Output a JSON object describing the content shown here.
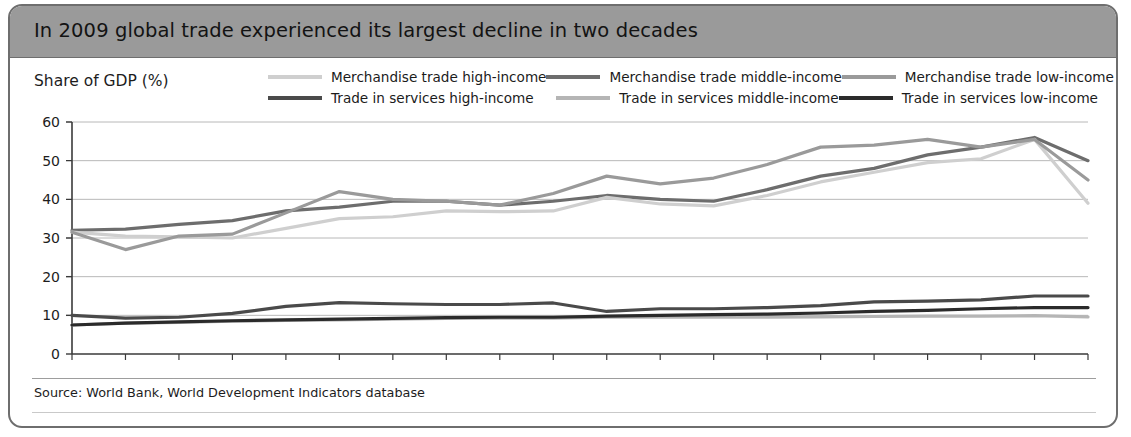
{
  "figure": {
    "title": "In 2009 global trade experienced its largest decline in two decades",
    "source": "Source: World Bank, World Development Indicators database",
    "axis_title": "Share of GDP (%)"
  },
  "colors": {
    "merch_high": "#cfcfcf",
    "merch_middle": "#6d6d6d",
    "merch_low": "#9a9a9a",
    "serv_high": "#4a4a4a",
    "serv_middle": "#b5b5b5",
    "serv_low": "#2b2b2b",
    "header_bg": "#9a9a9a",
    "frame": "#6e6e6e",
    "grid": "#b8b8b8"
  },
  "chart_data": {
    "type": "line",
    "title": "In 2009 global trade experienced its largest decline in two decades",
    "xlabel": "",
    "ylabel": "Share of GDP (%)",
    "ylim": [
      0,
      60
    ],
    "yticks": [
      0,
      10,
      20,
      30,
      40,
      50,
      60
    ],
    "grid": true,
    "legend_position": "top",
    "x": [
      1990,
      1991,
      1992,
      1993,
      1994,
      1995,
      1996,
      1997,
      1998,
      1999,
      2000,
      2001,
      2002,
      2003,
      2004,
      2005,
      2006,
      2007,
      2008,
      2009
    ],
    "xticklabels": [
      "1990",
      "1991",
      "1992",
      "1993",
      "1994",
      "1995",
      "1996",
      "1997",
      "1998",
      "1999",
      "2000",
      "2001",
      "2002",
      "2003",
      "2004",
      "2005",
      "2006",
      "2007",
      "2008",
      "2009"
    ],
    "series": [
      {
        "name": "Merchandise trade high-income",
        "color": "#cfcfcf",
        "values": [
          31.5,
          30.5,
          30.3,
          30.0,
          32.5,
          35.0,
          35.5,
          37.0,
          36.8,
          37.0,
          40.5,
          38.8,
          38.3,
          41.0,
          44.5,
          47.0,
          49.5,
          50.5,
          55.5,
          39.0
        ]
      },
      {
        "name": "Merchandise trade middle-income",
        "color": "#6d6d6d",
        "values": [
          32.0,
          32.3,
          33.5,
          34.5,
          37.0,
          38.0,
          39.5,
          39.5,
          38.5,
          39.5,
          41.0,
          40.0,
          39.5,
          42.5,
          46.0,
          48.0,
          51.5,
          53.5,
          56.0,
          50.0
        ]
      },
      {
        "name": "Merchandise trade low-income",
        "color": "#9a9a9a",
        "values": [
          31.5,
          27.0,
          30.5,
          31.0,
          36.5,
          42.0,
          40.0,
          39.5,
          38.5,
          41.5,
          46.0,
          44.0,
          45.5,
          49.0,
          53.5,
          54.0,
          55.5,
          53.5,
          55.5,
          45.0
        ]
      },
      {
        "name": "Trade in services high-income",
        "color": "#4a4a4a",
        "values": [
          10.0,
          9.3,
          9.5,
          10.5,
          12.3,
          13.3,
          13.0,
          12.8,
          12.8,
          13.2,
          11.0,
          11.7,
          11.7,
          12.0,
          12.5,
          13.5,
          13.7,
          14.0,
          15.0,
          15.0
        ]
      },
      {
        "name": "Trade in services middle-income",
        "color": "#b5b5b5",
        "values": [
          7.5,
          8.0,
          8.2,
          8.5,
          8.7,
          8.8,
          9.0,
          9.2,
          9.3,
          9.3,
          9.5,
          9.5,
          9.5,
          9.5,
          9.6,
          9.7,
          9.8,
          9.8,
          9.9,
          9.6
        ]
      },
      {
        "name": "Trade in services low-income",
        "color": "#2b2b2b",
        "values": [
          7.5,
          8.0,
          8.3,
          8.6,
          8.8,
          9.0,
          9.2,
          9.4,
          9.5,
          9.5,
          9.8,
          10.0,
          10.2,
          10.3,
          10.6,
          11.0,
          11.3,
          11.7,
          12.0,
          12.0
        ]
      }
    ]
  },
  "legend": {
    "rows": [
      [
        {
          "label": "Merchandise trade high-income",
          "color": "#cfcfcf"
        },
        {
          "label": "Merchandise trade middle-income",
          "color": "#6d6d6d"
        },
        {
          "label": "Merchandise trade low-income",
          "color": "#9a9a9a"
        }
      ],
      [
        {
          "label": "Trade in services high-income",
          "color": "#4a4a4a"
        },
        {
          "label": "Trade in services middle-income",
          "color": "#b5b5b5"
        },
        {
          "label": "Trade in services low-income",
          "color": "#2b2b2b"
        }
      ]
    ]
  }
}
